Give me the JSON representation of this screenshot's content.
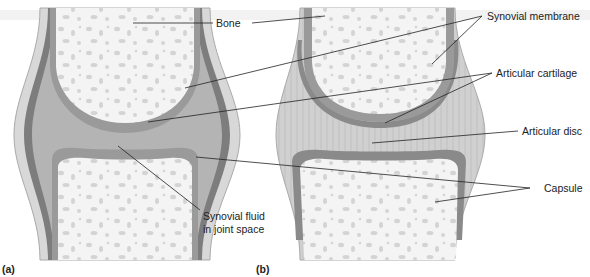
{
  "figure": {
    "panels": [
      {
        "id": "a",
        "label": "(a)"
      },
      {
        "id": "b",
        "label": "(b)"
      }
    ],
    "labels": {
      "bone": "Bone",
      "synovial_membrane": "Synovial membrane",
      "articular_cartilage": "Articular cartilage",
      "articular_disc": "Articular disc",
      "capsule": "Capsule",
      "synovial_fluid_line1": "Synovial fluid",
      "synovial_fluid_line2": "in joint space"
    },
    "colors": {
      "bone_marrow": "#f4f4f4",
      "bone_spots": "#d2d2d2",
      "cartilage": "#9a9a9a",
      "membrane": "#7a7a7a",
      "joint_space": "#b8b8b8",
      "capsule": "#c8c8c8",
      "disc": "#cfcfcf",
      "leader_line": "#222222"
    }
  }
}
